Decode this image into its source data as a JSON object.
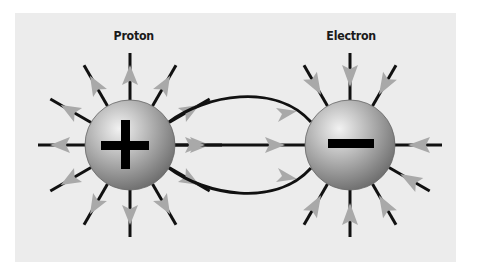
{
  "diagram": {
    "background_color": "#ececec",
    "particles": [
      {
        "id": "proton",
        "label": "Proton",
        "charge_symbol": "+",
        "center": [
          130,
          145
        ],
        "radius": 45,
        "field_direction": "outward"
      },
      {
        "id": "electron",
        "label": "Electron",
        "charge_symbol": "−",
        "center": [
          350,
          145
        ],
        "radius": 45,
        "field_direction": "inward"
      }
    ],
    "field_line_count_per_particle": 12,
    "connecting_lines": 3,
    "colors": {
      "line": "#111111",
      "arrowhead": "#a9a9a9",
      "sphere_light": "#e6e6e6",
      "sphere_dark": "#7a7a7a",
      "symbol": "#000000"
    }
  }
}
